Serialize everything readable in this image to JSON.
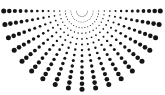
{
  "figure": {
    "title": "Radial Dot Fan",
    "type": "radial-dot-burst",
    "background_color": "#ffffff",
    "dot_color": "#151515",
    "width": 165,
    "height": 95
  },
  "chart_data": {
    "type": "scatter",
    "title": "Radial Dot Fan",
    "subtitle": "",
    "xlabel": "",
    "ylabel": "",
    "xlim": [
      0,
      165
    ],
    "ylim": [
      0,
      95
    ],
    "grid": false,
    "legend": null,
    "annotations": [],
    "geometry": {
      "origin_x": 82,
      "origin_y": 11,
      "ray_count": 19,
      "dots_per_ray": 14,
      "angle_start_deg": 0,
      "angle_end_deg": 180,
      "angle_step_deg": 10,
      "radius_first": 5.5,
      "radius_step": 5.6,
      "radius_last": 78.3,
      "dot_radius_min": 0.35,
      "dot_radius_max": 2.5,
      "dot_radius_growth": "linear_with_radius",
      "color": "#151515",
      "extent_left_x": 14,
      "extent_right_x": 150,
      "extent_bottom_y": 87,
      "extent_top_y": 9
    }
  }
}
